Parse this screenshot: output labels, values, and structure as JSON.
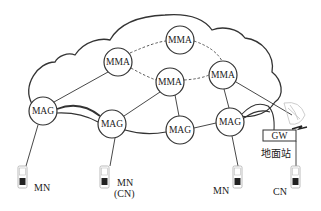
{
  "diagram": {
    "type": "network-topology",
    "cloud": {
      "name": "core-network-cloud"
    },
    "mma_nodes": [
      {
        "id": "mma-top",
        "label": "MMA",
        "cx": 180,
        "cy": 40
      },
      {
        "id": "mma-left",
        "label": "MMA",
        "cx": 118,
        "cy": 62
      },
      {
        "id": "mma-right",
        "label": "MMA",
        "cx": 223,
        "cy": 75
      },
      {
        "id": "mma-middle",
        "label": "MMA",
        "cx": 170,
        "cy": 82
      }
    ],
    "mag_nodes": [
      {
        "id": "mag-1",
        "label": "MAG",
        "cx": 43,
        "cy": 111
      },
      {
        "id": "mag-2",
        "label": "MAG",
        "cx": 112,
        "cy": 124
      },
      {
        "id": "mag-3",
        "label": "MAG",
        "cx": 180,
        "cy": 130
      },
      {
        "id": "mag-4",
        "label": "MAG",
        "cx": 230,
        "cy": 122
      }
    ],
    "gateway": {
      "label": "GW",
      "sublabel": "地面站"
    },
    "terminals": [
      {
        "id": "term-1",
        "label": "MN",
        "sublabel": ""
      },
      {
        "id": "term-2",
        "label": "MN",
        "sublabel": "(CN)"
      },
      {
        "id": "term-3",
        "label": "MN",
        "sublabel": ""
      },
      {
        "id": "term-4",
        "label": "CN",
        "sublabel": ""
      }
    ],
    "colors": {
      "line": "#333333",
      "background": "#ffffff",
      "dish": "#bbbbbb"
    }
  }
}
